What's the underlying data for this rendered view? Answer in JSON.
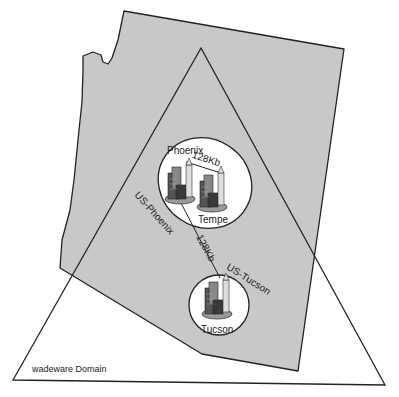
{
  "diagram": {
    "region": "Arizona",
    "domain_label": "wadeware Domain",
    "sites": [
      {
        "name": "Phoenix"
      },
      {
        "name": "Tempe"
      },
      {
        "name": "Tucson"
      }
    ],
    "links": [
      {
        "from": "Phoenix",
        "to": "Tempe",
        "label": "128Kb"
      },
      {
        "from": "Phoenix",
        "to": "Tucson",
        "label": "128Kb"
      }
    ],
    "site_groups": [
      {
        "label": "US-Phoenix"
      },
      {
        "label": "US-Tucson"
      }
    ],
    "colors": {
      "state_fill": "#c8c8c8",
      "stroke": "#222222",
      "background": "#ffffff"
    }
  }
}
